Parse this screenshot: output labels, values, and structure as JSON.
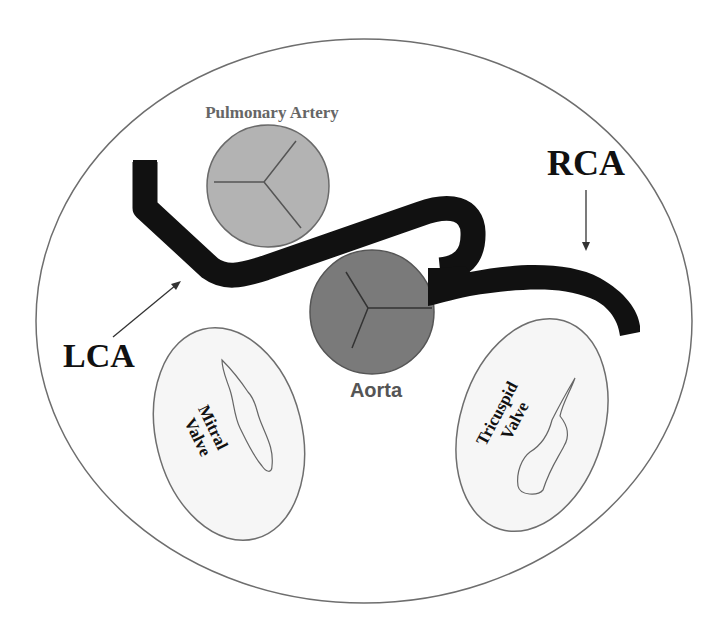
{
  "colors": {
    "background": "#ffffff",
    "outline": "#6e6e6e",
    "vessel": "#111111",
    "pulmonary_fill": "#b3b3b3",
    "aorta_fill": "#7a7a7a",
    "valve_fill": "#f6f6f6",
    "label_dark": "#111111",
    "label_gray": "#555555",
    "pulmonary_label": "#666666"
  },
  "labels": {
    "pulmonary_artery": "Pulmonary Artery",
    "aorta": "Aorta",
    "rca": "RCA",
    "lca": "LCA",
    "mitral_valve_line1": "Mitral",
    "mitral_valve_line2": "Valve",
    "tricuspid_valve_line1": "Tricuspid",
    "tricuspid_valve_line2": "Valve"
  },
  "structures": [
    {
      "name": "Pulmonary Artery",
      "shape": "circle",
      "cusps": 3
    },
    {
      "name": "Aorta",
      "shape": "circle",
      "cusps": 3
    },
    {
      "name": "Mitral Valve",
      "shape": "ellipse"
    },
    {
      "name": "Tricuspid Valve",
      "shape": "ellipse"
    },
    {
      "name": "LCA",
      "shape": "vessel"
    },
    {
      "name": "RCA",
      "shape": "vessel"
    }
  ]
}
